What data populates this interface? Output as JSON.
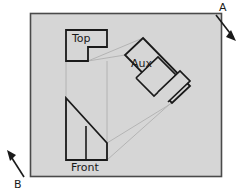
{
  "diagram": {
    "type": "engineering-drawing",
    "background_color": "#ffffff",
    "sheet": {
      "name": "drawing-sheet",
      "fill_color": "#d6d6d6",
      "stroke_color": "#4a4a4a",
      "x": 30,
      "y": 13,
      "width": 192,
      "height": 164
    },
    "line_colors": {
      "object": "#1a1a1a",
      "projection": "#b0b0b0",
      "frame": "#4a4a4a"
    },
    "views": [
      {
        "id": "top",
        "label": "Top",
        "label_x": 72,
        "label_y": 42,
        "outline_points": "66,30 107,30 107,47 88,47 88,61 66,61",
        "description": "L-shaped top view outline"
      },
      {
        "id": "front",
        "label": "Front",
        "label_x": 71,
        "label_y": 171,
        "outline_points": "66,98 66,160 107,160 107,143",
        "interior_line": {
          "x1": 86,
          "y1": 126,
          "x2": 86,
          "y2": 160
        },
        "description": "Right trapezoid front view with vertical interior edge"
      },
      {
        "id": "aux",
        "label": "Aux",
        "label_x": 131,
        "label_y": 67,
        "outline_points": "143,38 190,86 172,103 125,55",
        "interior_lines": [
          {
            "x1": 136,
            "y1": 77,
            "x2": 158,
            "y2": 99
          },
          {
            "x1": 160,
            "y1": 54,
            "x2": 182,
            "y2": 76
          },
          {
            "x1": 150,
            "y1": 63,
            "x2": 172,
            "y2": 85
          }
        ],
        "description": "Rotated rectangular auxiliary view with stepped divisions"
      }
    ],
    "projection_lines": [
      {
        "x1": 66,
        "y1": 61,
        "x2": 66,
        "y2": 98
      },
      {
        "x1": 107,
        "y1": 61,
        "x2": 107,
        "y2": 143
      },
      {
        "x1": 88,
        "y1": 61,
        "x2": 125,
        "y2": 55
      },
      {
        "x1": 107,
        "y1": 143,
        "x2": 172,
        "y2": 103
      },
      {
        "x1": 107,
        "y1": 160,
        "x2": 190,
        "y2": 86
      },
      {
        "x1": 88,
        "y1": 61,
        "x2": 143,
        "y2": 38
      }
    ],
    "arrows": [
      {
        "id": "a",
        "label": "A",
        "label_x": 221,
        "label_y": 11,
        "direction": "southeast",
        "shaft": {
          "x1": 216,
          "y1": 15,
          "x2": 235,
          "y2": 39
        },
        "head_points": "235,39 227,37 231,31"
      },
      {
        "id": "b",
        "label": "B",
        "label_x": 17,
        "label_y": 187,
        "direction": "northwest",
        "shaft": {
          "x1": 24,
          "y1": 177,
          "x2": 8,
          "y2": 152
        },
        "head_points": "8,152 16,155 11,160"
      }
    ]
  }
}
